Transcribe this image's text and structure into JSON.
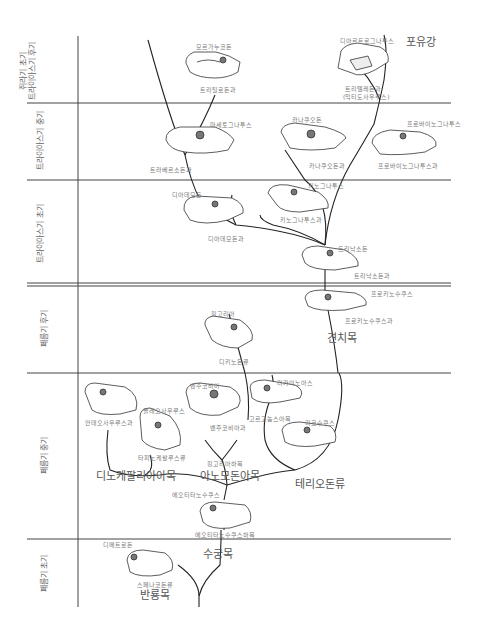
{
  "periods": [
    {
      "label_line1": "쥐라기 초기",
      "label_line2": "트라이아스기 후기"
    },
    {
      "label": "트라이아스기 중기"
    },
    {
      "label": "트라이아스기 초기"
    },
    {
      "label": "페름기 후기"
    },
    {
      "label": "페름기 중기"
    },
    {
      "label": "페름기 초기"
    }
  ],
  "taxa": {
    "morganucodon": "모르가누코돈",
    "tritylodontidae": "트리틸로돈과",
    "massetognathus": "마세토그나투스",
    "traversodontidae": "트라베르소돈과",
    "kannemeyerid_genus": "카나쿠오돈",
    "kannemeyerid_family": "카나쿠오돈과",
    "diarthrognathus": "디아르트로그나투스",
    "trithelodontidae": "트리텔레돈과",
    "ictidosaurus": "(익티도사우루스)",
    "probainognathus": "프로바이노그나투스",
    "probainognathidae": "프로바이노그나투스과",
    "mammalia": "포유강",
    "diademodon": "디아데모돈",
    "diademodontidae": "디아데모돈과",
    "cynognathus": "키노그나투스",
    "cynognathidae": "키노그나투스과",
    "thrinaxodon": "트리낙소돈",
    "thrinaxodontidae": "트리낙소돈과",
    "procynosuchus": "프로키노수쿠스",
    "procynosuchidae": "프로키노수쿠스과",
    "cynodontia": "견치목",
    "kingoria": "킹고리아",
    "dicynodontia": "디키노돈류",
    "venjukovia": "벤주코비아",
    "venjukoviidae": "벤주코비아과",
    "kingoriinae": "킹고리아하목",
    "anomodontia": "아노모돈아목",
    "lycaenops": "리카이노아스",
    "gorgonopsia": "고르고놉스아목",
    "lycosuchus": "리코수쿠스",
    "theriodontia": "테리오돈류",
    "anteosaurus_family": "안테오사우루스과",
    "moschops": "몰레오사우루스",
    "tapinocephalia": "타피노케팔루스류",
    "dinocephalia": "디노케팔리아아목",
    "eotitanosuchus": "에오티타노수쿠스",
    "eotitanosuchia": "에오티타노수쿠스하목",
    "therapsida": "수궁목",
    "dimetrodon": "디메트로돈",
    "sphenacodontia": "스페나코돈류",
    "pelycosauria": "반룡목"
  }
}
